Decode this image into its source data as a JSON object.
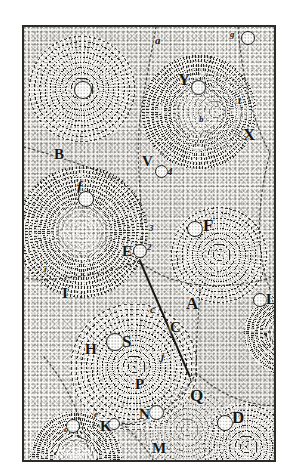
{
  "plate": {
    "title": "Cartesian vortex cosmology plate",
    "description": "Engraved plate of contiguous celestial vortices rendered in stipple, with a comet path traversing between vortices",
    "frame_color": "#2b2b28",
    "ink_color": "#1a1a17",
    "paper_color": "#fcfbf8"
  },
  "vortices": [
    {
      "id": "top-left",
      "label": "",
      "cx": 58,
      "cy": 62,
      "r": 54,
      "style": "rings",
      "has_body": true
    },
    {
      "id": "B",
      "label": "B",
      "cx": 58,
      "cy": 205,
      "r": 66,
      "style": "rays",
      "has_body": false
    },
    {
      "id": "Y",
      "label": "Y",
      "cx": 175,
      "cy": 85,
      "r": 58,
      "style": "rays",
      "has_body": true
    },
    {
      "id": "F",
      "label": "F",
      "cx": 195,
      "cy": 228,
      "r": 50,
      "style": "rings",
      "has_body": true
    },
    {
      "id": "S",
      "label": "S",
      "cx": 110,
      "cy": 340,
      "r": 64,
      "style": "rings",
      "has_body": true
    },
    {
      "id": "D",
      "label": "D",
      "cx": 222,
      "cy": 420,
      "r": 46,
      "style": "rings",
      "has_body": true
    },
    {
      "id": "L",
      "label": "L",
      "cx": 262,
      "cy": 306,
      "r": 42,
      "style": "rays",
      "has_body": true
    },
    {
      "id": "bottom-left",
      "label": "",
      "cx": 52,
      "cy": 430,
      "r": 46,
      "style": "rays",
      "has_body": true
    }
  ],
  "labels": {
    "capitals": [
      {
        "name": "label-B",
        "text": "B",
        "x": 52,
        "y": 152
      },
      {
        "name": "label-Y",
        "text": "Y",
        "x": 178,
        "y": 74
      },
      {
        "name": "label-X",
        "text": "X",
        "x": 243,
        "y": 129
      },
      {
        "name": "label-V",
        "text": "V",
        "x": 144,
        "y": 158
      },
      {
        "name": "label-F",
        "text": "F",
        "x": 201,
        "y": 218
      },
      {
        "name": "label-E",
        "text": "E",
        "x": 124,
        "y": 248
      },
      {
        "name": "label-A",
        "text": "A",
        "x": 186,
        "y": 298
      },
      {
        "name": "label-C",
        "text": "C",
        "x": 172,
        "y": 323
      },
      {
        "name": "label-H",
        "text": "H",
        "x": 85,
        "y": 347
      },
      {
        "name": "label-S",
        "text": "S",
        "x": 122,
        "y": 338
      },
      {
        "name": "label-L",
        "text": "L",
        "x": 266,
        "y": 297
      },
      {
        "name": "label-P",
        "text": "P",
        "x": 135,
        "y": 380
      },
      {
        "name": "label-Q",
        "text": "Q",
        "x": 190,
        "y": 392
      },
      {
        "name": "label-N",
        "text": "N",
        "x": 141,
        "y": 411
      },
      {
        "name": "label-M",
        "text": "M",
        "x": 152,
        "y": 445
      },
      {
        "name": "label-D",
        "text": "D",
        "x": 232,
        "y": 414
      },
      {
        "name": "label-K",
        "text": "K",
        "x": 100,
        "y": 424
      },
      {
        "name": "label-I",
        "text": "I",
        "x": 62,
        "y": 291
      }
    ],
    "minuscules": [
      {
        "name": "label-f-script",
        "text": "ƒ",
        "x": 76,
        "y": 188
      },
      {
        "name": "label-a",
        "text": "a",
        "x": 155,
        "y": 40
      },
      {
        "name": "label-g",
        "text": "g",
        "x": 228,
        "y": 31
      },
      {
        "name": "label-t",
        "text": "t",
        "x": 238,
        "y": 99
      },
      {
        "name": "label-b",
        "text": "b",
        "x": 199,
        "y": 117
      },
      {
        "name": "label-s",
        "text": "s",
        "x": 158,
        "y": 152
      },
      {
        "name": "label-4",
        "text": "4",
        "x": 166,
        "y": 171
      },
      {
        "name": "label-3",
        "text": "3",
        "x": 148,
        "y": 229
      },
      {
        "name": "label-2",
        "text": "2",
        "x": 146,
        "y": 247
      },
      {
        "name": "label-c",
        "text": "c",
        "x": 150,
        "y": 307
      },
      {
        "name": "label-j",
        "text": "j",
        "x": 160,
        "y": 356
      },
      {
        "name": "label-e",
        "text": "e",
        "x": 95,
        "y": 414
      },
      {
        "name": "label-o",
        "text": "o",
        "x": 64,
        "y": 428
      },
      {
        "name": "label-i",
        "text": "i",
        "x": 44,
        "y": 269
      }
    ],
    "bodies": [
      {
        "name": "body-topleft",
        "cx": 58,
        "cy": 62,
        "r": 8
      },
      {
        "name": "body-Y",
        "cx": 193,
        "cy": 79,
        "r": 6
      },
      {
        "name": "body-g",
        "cx": 243,
        "cy": 30,
        "r": 6
      },
      {
        "name": "body-f",
        "cx": 83,
        "cy": 196,
        "r": 7
      },
      {
        "name": "body-V",
        "cx": 161,
        "cy": 168,
        "r": 5
      },
      {
        "name": "body-F",
        "cx": 190,
        "cy": 224,
        "r": 7
      },
      {
        "name": "body-E",
        "cx": 137,
        "cy": 248,
        "r": 6
      },
      {
        "name": "body-S",
        "cx": 110,
        "cy": 338,
        "r": 8
      },
      {
        "name": "body-L",
        "cx": 256,
        "cy": 298,
        "r": 6
      },
      {
        "name": "body-N",
        "cx": 153,
        "cy": 409,
        "r": 7
      },
      {
        "name": "body-D",
        "cx": 221,
        "cy": 420,
        "r": 7
      },
      {
        "name": "body-o",
        "cx": 70,
        "cy": 424,
        "r": 6
      },
      {
        "name": "body-K",
        "cx": 112,
        "cy": 422,
        "r": 5
      }
    ]
  },
  "comet_path": {
    "name": "comet-path",
    "description": "solid ruled line from E through C toward lower right",
    "points": "115,232 140,300 165,345"
  }
}
